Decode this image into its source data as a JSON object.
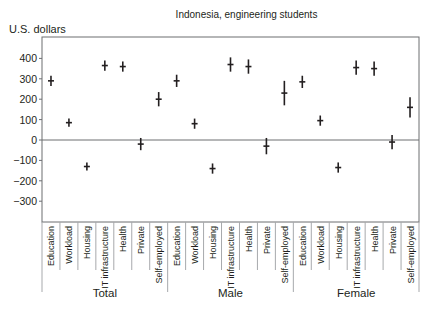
{
  "chart_data": {
    "type": "scatter",
    "subtype": "point estimates with error bars",
    "title": "Indonesia, engineering students",
    "xlabel": "",
    "ylabel": "U.S. dollars",
    "ylim": [
      -400,
      500
    ],
    "yticks": [
      400,
      300,
      200,
      100,
      0,
      -100,
      -200,
      -300
    ],
    "ytick_labels": [
      "400",
      "300",
      "200",
      "100",
      "0",
      "−100",
      "−200",
      "−300"
    ],
    "grid": false,
    "legend": null,
    "groups": [
      "Total",
      "Male",
      "Female"
    ],
    "categories": [
      "Education",
      "Workload",
      "Housing",
      "IT infrastructure",
      "Health",
      "Private",
      "Self-employed"
    ],
    "series": [
      {
        "name": "Total",
        "values": [
          290,
          85,
          -130,
          365,
          360,
          -20,
          200
        ],
        "error": [
          25,
          20,
          20,
          25,
          25,
          30,
          35
        ]
      },
      {
        "name": "Male",
        "values": [
          290,
          80,
          -140,
          370,
          360,
          -30,
          230
        ],
        "error": [
          30,
          25,
          25,
          35,
          35,
          40,
          60
        ]
      },
      {
        "name": "Female",
        "values": [
          285,
          95,
          -135,
          355,
          350,
          -10,
          160
        ],
        "error": [
          30,
          25,
          25,
          35,
          35,
          35,
          50
        ]
      }
    ]
  },
  "header": {
    "title": "Indonesia, engineering students",
    "y_axis_label": "U.S. dollars"
  }
}
